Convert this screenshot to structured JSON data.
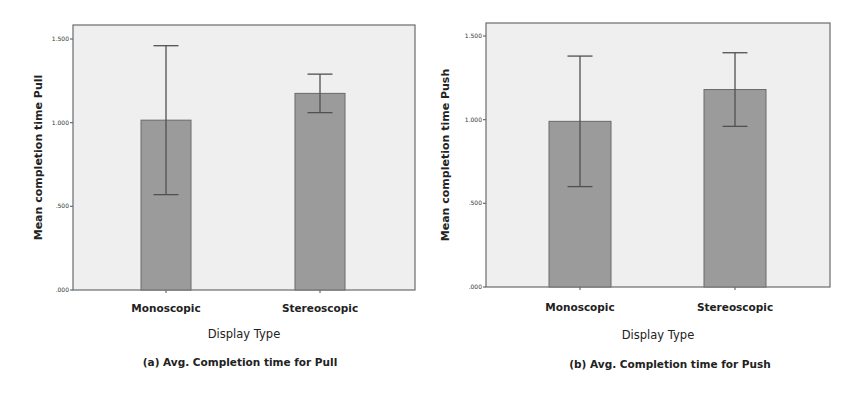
{
  "figure": {
    "panels": [
      {
        "id": "a",
        "caption": "(a) Avg. Completion time for Pull",
        "ylabel": "Mean completion time Pull",
        "xlabel": "Display Type"
      },
      {
        "id": "b",
        "caption": "(b) Avg. Completion time for Push",
        "ylabel": "Mean completion time Push",
        "xlabel": "Display Type"
      }
    ],
    "colors": {
      "bar": "#9b9b9b",
      "bar_edge": "#6a6a6a",
      "plot_background": "#efefef",
      "error_bar": "#505050"
    }
  },
  "chart_data": [
    {
      "type": "bar",
      "title": "(a) Avg. Completion time for Pull",
      "xlabel": "Display Type",
      "ylabel": "Mean completion time Pull",
      "categories": [
        "Monoscopic",
        "Stereoscopic"
      ],
      "values": [
        1.015,
        1.175
      ],
      "error_bars": {
        "upper": [
          1.46,
          1.29
        ],
        "lower": [
          0.57,
          1.06
        ]
      },
      "ylim": [
        0,
        1.6
      ],
      "yticks": [
        0,
        0.5,
        1.0,
        1.5
      ],
      "ytick_labels": [
        ".000",
        ".500",
        "1.000",
        "1.500"
      ],
      "grid": false,
      "legend": null
    },
    {
      "type": "bar",
      "title": "(b) Avg. Completion time for Push",
      "xlabel": "Display Type",
      "ylabel": "Mean completion time Push",
      "categories": [
        "Monoscopic",
        "Stereoscopic"
      ],
      "values": [
        0.99,
        1.18
      ],
      "error_bars": {
        "upper": [
          1.38,
          1.4
        ],
        "lower": [
          0.6,
          0.96
        ]
      },
      "ylim": [
        0,
        1.6
      ],
      "yticks": [
        0,
        0.5,
        1.0,
        1.5
      ],
      "ytick_labels": [
        ".000",
        ".500",
        "1.000",
        "1.500"
      ],
      "grid": false,
      "legend": null
    }
  ]
}
